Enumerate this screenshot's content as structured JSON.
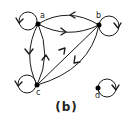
{
  "caption": "(b)",
  "colors": {
    "stroke": "#1a1a1a",
    "node": "#000000",
    "background": "#ffffff"
  },
  "nodes": [
    {
      "id": "a",
      "label": "a",
      "x": 38,
      "y": 24
    },
    {
      "id": "b",
      "label": "b",
      "x": 99,
      "y": 25
    },
    {
      "id": "c",
      "label": "c",
      "x": 37,
      "y": 85
    },
    {
      "id": "d",
      "label": "d",
      "x": 98,
      "y": 88
    }
  ],
  "edges": [
    {
      "from": "a",
      "to": "a",
      "type": "self-loop",
      "side": "left"
    },
    {
      "from": "b",
      "to": "b",
      "type": "self-loop",
      "side": "right"
    },
    {
      "from": "c",
      "to": "c",
      "type": "self-loop",
      "side": "left"
    },
    {
      "from": "d",
      "to": "d",
      "type": "self-loop",
      "side": "right"
    },
    {
      "from": "b",
      "to": "a",
      "type": "curved",
      "position": "upper"
    },
    {
      "from": "a",
      "to": "b",
      "type": "curved",
      "position": "lower"
    },
    {
      "from": "a",
      "to": "c",
      "type": "curved",
      "position": "left"
    },
    {
      "from": "c",
      "to": "a",
      "type": "curved",
      "position": "right"
    },
    {
      "from": "c",
      "to": "b",
      "type": "straight"
    },
    {
      "from": "b",
      "to": "c",
      "type": "curved",
      "position": "outer"
    }
  ]
}
